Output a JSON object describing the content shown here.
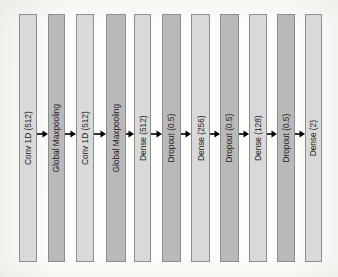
{
  "figure": {
    "type": "neural-network-architecture-diagram",
    "orientation": "left-to-right",
    "background_color": "#fdfdfb",
    "label_rotation_degrees": -90,
    "connector": "arrow-right-icon",
    "connector_color": "#000000",
    "bar_border_color": "#8d8d8d",
    "bar_fill_light": "#d9d9d9",
    "bar_fill_dark": "#b9b9b9",
    "layer_count": 11
  },
  "layers": [
    {
      "label": "Conv 1D (512)",
      "name": "layer-conv1d-512-a",
      "shade": "light",
      "x": 19,
      "width": 18
    },
    {
      "label": "Global Maxpooling",
      "name": "layer-global-maxpooling-a",
      "shade": "dark",
      "x": 48,
      "width": 17
    },
    {
      "label": "Conv 1D (512)",
      "name": "layer-conv1d-512-b",
      "shade": "light",
      "x": 76,
      "width": 18
    },
    {
      "label": "Global Maxpooling",
      "name": "layer-global-maxpooling-b",
      "shade": "dark",
      "x": 106,
      "width": 20
    },
    {
      "label": "Dense (512)",
      "name": "layer-dense-512",
      "shade": "light",
      "x": 134,
      "width": 17
    },
    {
      "label": "Dropout (0.5)",
      "name": "layer-dropout-05-a",
      "shade": "dark",
      "x": 162,
      "width": 19
    },
    {
      "label": "Dense (256)",
      "name": "layer-dense-256",
      "shade": "light",
      "x": 191,
      "width": 19
    },
    {
      "label": "Dropout (0.5)",
      "name": "layer-dropout-05-b",
      "shade": "dark",
      "x": 220,
      "width": 19
    },
    {
      "label": "Dense (128)",
      "name": "layer-dense-128",
      "shade": "light",
      "x": 249,
      "width": 18
    },
    {
      "label": "Dropout (0.5)",
      "name": "layer-dropout-05-c",
      "shade": "dark",
      "x": 277,
      "width": 18
    },
    {
      "label": "Dense (2)",
      "name": "layer-dense-2",
      "shade": "light",
      "x": 305,
      "width": 17
    }
  ],
  "arrows": [
    {
      "name": "arrow-1",
      "x": 37,
      "width": 11
    },
    {
      "name": "arrow-2",
      "x": 65,
      "width": 11
    },
    {
      "name": "arrow-3",
      "x": 94,
      "width": 12
    },
    {
      "name": "arrow-4",
      "x": 126,
      "width": 8
    },
    {
      "name": "arrow-5",
      "x": 151,
      "width": 11
    },
    {
      "name": "arrow-6",
      "x": 181,
      "width": 10
    },
    {
      "name": "arrow-7",
      "x": 210,
      "width": 10
    },
    {
      "name": "arrow-8",
      "x": 239,
      "width": 10
    },
    {
      "name": "arrow-9",
      "x": 267,
      "width": 10
    },
    {
      "name": "arrow-10",
      "x": 295,
      "width": 10
    }
  ]
}
